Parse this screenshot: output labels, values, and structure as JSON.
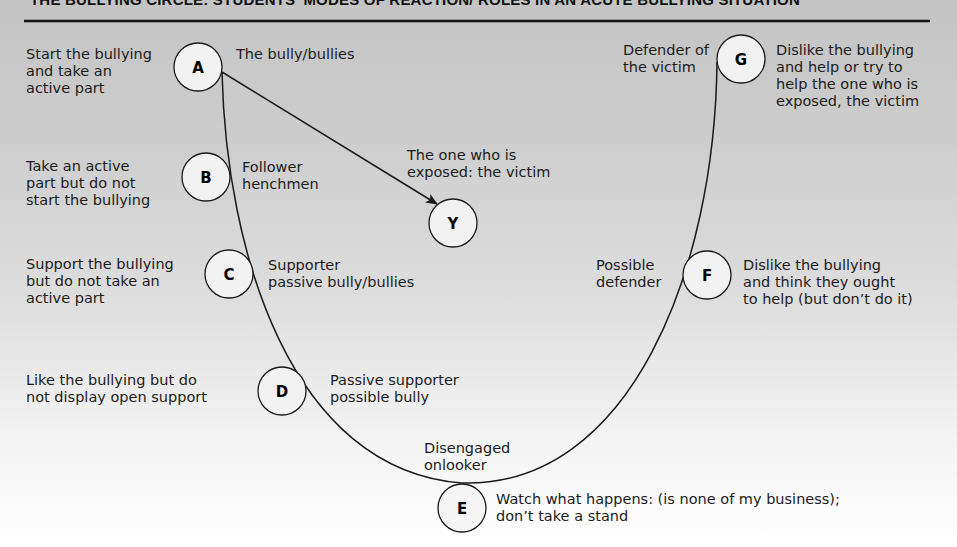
{
  "title": "THE BULLYING CIRCLE: STUDENTS' MODES OF REACTION/ ROLES IN AN ACUTE BULLYING SITUATION",
  "colors": {
    "line": "#1a1a1a",
    "node_fill": "#f2f2f2",
    "bg_top": "#c4c4c4",
    "bg_bottom": "#ffffff"
  },
  "nodes": {
    "A": {
      "letter": "A",
      "role": "The bully/bullies",
      "description": "Start the bullying\nand take an\nactive part"
    },
    "B": {
      "letter": "B",
      "role": "Follower\nhenchmen",
      "description": "Take an active\npart but do not\nstart the bullying"
    },
    "C": {
      "letter": "C",
      "role": "Supporter\npassive bully/bullies",
      "description": "Support the bullying\nbut do not take an\nactive part"
    },
    "D": {
      "letter": "D",
      "role": "Passive supporter\npossible bully",
      "description": "Like the bullying but do\nnot display open support"
    },
    "E": {
      "letter": "E",
      "role": "Disengaged\nonlooker",
      "description": "Watch what happens: (is none of my business);\ndon’t take a stand"
    },
    "F": {
      "letter": "F",
      "role": "Possible\ndefender",
      "description": "Dislike the bullying\nand think they ought\nto help (but don’t do it)"
    },
    "G": {
      "letter": "G",
      "role": "Defender of\nthe victim",
      "description": "Dislike the bullying\nand help or try to\nhelp the one who is\nexposed, the victim"
    },
    "Y": {
      "letter": "Y",
      "role": "The one who is\nexposed: the victim"
    }
  }
}
